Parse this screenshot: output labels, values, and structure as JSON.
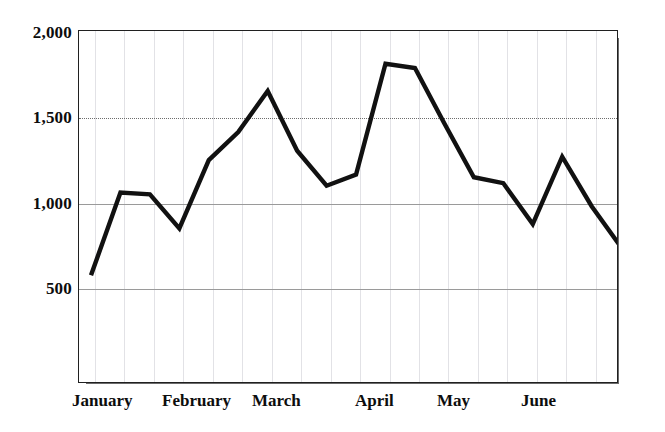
{
  "chart_data": {
    "type": "line",
    "title": "",
    "subtitle": "",
    "xlabel": "",
    "ylabel": "",
    "ylim": [
      0,
      2000
    ],
    "ytick_values": [
      500,
      1000,
      1500,
      2000
    ],
    "ytick_labels": [
      "500",
      "1,000",
      "1,500",
      "2,000"
    ],
    "grid": {
      "horizontal": true,
      "vertical": true,
      "horizontal_style": "solid-and-dotted",
      "vertical_style": "faint-solid",
      "vertical_count": 18
    },
    "legend": null,
    "legend_position": "none",
    "annotations": [],
    "month_labels": [
      "January",
      "February",
      "March",
      "April",
      "May",
      "June"
    ],
    "x": [
      1,
      2,
      3,
      4,
      5,
      6,
      7,
      8,
      9,
      10,
      11,
      12,
      13,
      14,
      15,
      16,
      17,
      18,
      19,
      20
    ],
    "categories": [
      "January w1",
      "January w2",
      "January w3",
      "January w4",
      "February w1",
      "February w2",
      "February w3",
      "February w4",
      "March w1",
      "March w2",
      "March w3",
      "March w4",
      "April w1",
      "April w2",
      "April w3",
      "April w4",
      "May w1",
      "May w2",
      "May w3",
      "June w1"
    ],
    "values": [
      580,
      1065,
      1055,
      855,
      1255,
      1420,
      1660,
      1310,
      1105,
      1170,
      1820,
      1795,
      1470,
      1155,
      1120,
      880,
      1275,
      985,
      745,
      880
    ],
    "series": [
      {
        "name": "series-1",
        "color": "#111111",
        "values": [
          580,
          1065,
          1055,
          855,
          1255,
          1420,
          1660,
          1310,
          1105,
          1170,
          1820,
          1795,
          1470,
          1155,
          1120,
          880,
          1275,
          985,
          745,
          880
        ]
      }
    ],
    "extra_points": [
      {
        "x": 20.6,
        "y": 885
      },
      {
        "x": 21.3,
        "y": 1175
      },
      {
        "x": 22.0,
        "y": 1075
      },
      {
        "x": 22.7,
        "y": 905
      }
    ]
  },
  "axis": {
    "y_ticks": [
      {
        "label": "2,000",
        "value": 2000
      },
      {
        "label": "1,500",
        "value": 1500
      },
      {
        "label": "1,000",
        "value": 1000
      },
      {
        "label": "500",
        "value": 500
      }
    ],
    "x_ticks": [
      {
        "label": "January"
      },
      {
        "label": "February"
      },
      {
        "label": "March"
      },
      {
        "label": "April"
      },
      {
        "label": "May"
      },
      {
        "label": "June"
      }
    ]
  },
  "colors": {
    "line": "#111111",
    "frame": "#202020",
    "shadow": "#6b6b6b",
    "gridline_major": "#9a9a9a",
    "gridline_minor": "#e2e2e6",
    "background": "#ffffff",
    "text": "#0d0d0d"
  }
}
